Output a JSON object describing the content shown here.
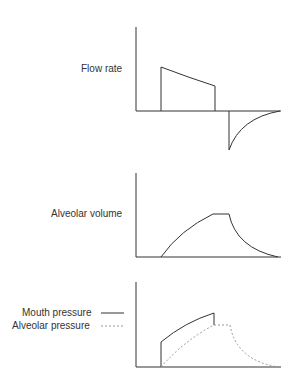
{
  "panels": [
    {
      "label": "Flow rate"
    },
    {
      "label": "Alveolar volume"
    },
    {
      "label": "Mouth pressure",
      "label2": "Alveolar pressure"
    }
  ],
  "legend": {
    "mouth_pressure": {
      "label": "Mouth pressure",
      "style": "solid"
    },
    "alveolar_pressure": {
      "label": "Alveolar pressure",
      "style": "dashed"
    }
  },
  "colors": {
    "line": "#333333",
    "dashed": "#999999"
  }
}
